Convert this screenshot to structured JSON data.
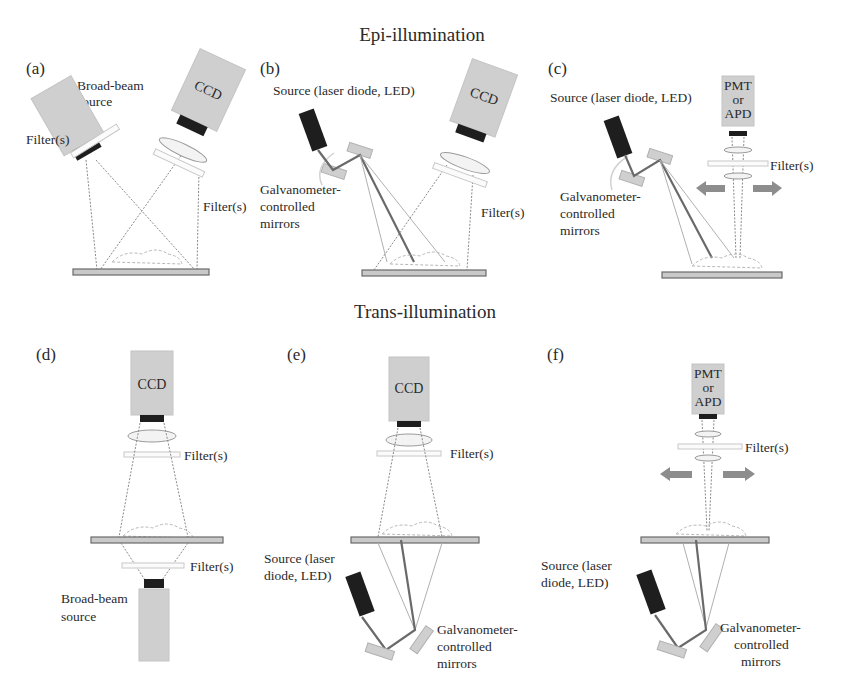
{
  "figure": {
    "sections": {
      "epi_title": "Epi-illumination",
      "trans_title": "Trans-illumination"
    },
    "panels": {
      "a": {
        "label": "(a)",
        "source_label_line1": "Broad-beam",
        "source_label_line2": "source",
        "detector_label": "CCD",
        "filter_left_label": "Filter(s)",
        "filter_right_label": "Filter(s)"
      },
      "b": {
        "label": "(b)",
        "source_label": "Source (laser diode, LED)",
        "detector_label": "CCD",
        "mirrors_label_line1": "Galvanometer-",
        "mirrors_label_line2": "controlled",
        "mirrors_label_line3": "mirrors",
        "filter_label": "Filter(s)"
      },
      "c": {
        "label": "(c)",
        "source_label": "Source (laser diode, LED)",
        "detector_line1": "PMT",
        "detector_line2": "or",
        "detector_line3": "APD",
        "filter_label": "Filter(s)",
        "mirrors_label_line1": "Galvanometer-",
        "mirrors_label_line2": "controlled",
        "mirrors_label_line3": "mirrors"
      },
      "d": {
        "label": "(d)",
        "detector_label": "CCD",
        "filter_top_label": "Filter(s)",
        "filter_bottom_label": "Filter(s)",
        "source_label_line1": "Broad-beam",
        "source_label_line2": "source"
      },
      "e": {
        "label": "(e)",
        "detector_label": "CCD",
        "filter_label": "Filter(s)",
        "source_label_line1": "Source (laser",
        "source_label_line2": "diode, LED)",
        "mirrors_label_line1": "Galvanometer-",
        "mirrors_label_line2": "controlled",
        "mirrors_label_line3": "mirrors"
      },
      "f": {
        "label": "(f)",
        "detector_line1": "PMT",
        "detector_line2": "or",
        "detector_line3": "APD",
        "filter_label": "Filter(s)",
        "source_label_line1": "Source (laser",
        "source_label_line2": "diode, LED)",
        "mirrors_label_line1": "Galvanometer-",
        "mirrors_label_line2": "controlled",
        "mirrors_label_line3": "mirrors"
      }
    }
  }
}
